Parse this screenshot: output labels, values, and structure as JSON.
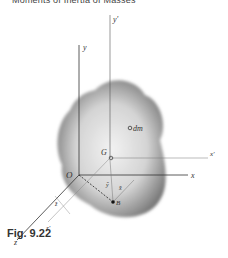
{
  "header": {
    "title": "Moments of Inertia of Masses"
  },
  "figure": {
    "caption": "Fig. 9.22",
    "labels": {
      "y": "y",
      "y_prime": "y'",
      "x": "x",
      "x_prime": "x'",
      "z": "z",
      "z_prime": "z'",
      "origin": "O",
      "centroid": "G",
      "element": "dm",
      "point": "B",
      "dim_x": "x̄",
      "dim_y": "ȳ",
      "dim_z": "z̄"
    }
  }
}
